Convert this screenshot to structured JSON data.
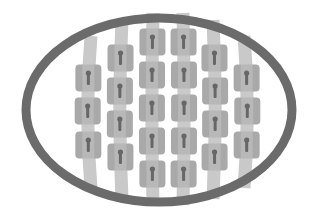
{
  "diagram": {
    "type": "illustration",
    "colors": {
      "background": "#ffffff",
      "ellipse_stroke": "#6b6b6b",
      "strap": "#c9c9c9",
      "block": "#a9a9a9",
      "keyhole": "#676767"
    },
    "ellipse": {
      "cx": 159,
      "cy": 110,
      "rx": 133,
      "ry": 92,
      "stroke_width": 9
    },
    "block_size": {
      "w": 26,
      "h": 27
    },
    "columns": [
      {
        "x": 88,
        "strap_top": 36,
        "strap_bottom": 188,
        "curve": -6,
        "blocks": [
          78,
          111,
          145
        ]
      },
      {
        "x": 120,
        "strap_top": 20,
        "strap_bottom": 199,
        "curve": -4,
        "blocks": [
          58,
          91,
          124,
          157
        ]
      },
      {
        "x": 152,
        "strap_top": 13,
        "strap_bottom": 205,
        "curve": -2,
        "blocks": [
          42,
          75,
          108,
          141,
          174
        ]
      },
      {
        "x": 184,
        "strap_top": 13,
        "strap_bottom": 205,
        "curve": 2,
        "blocks": [
          42,
          75,
          108,
          141,
          174
        ]
      },
      {
        "x": 215,
        "strap_top": 20,
        "strap_bottom": 199,
        "curve": 4,
        "blocks": [
          58,
          91,
          124,
          157
        ]
      },
      {
        "x": 247,
        "strap_top": 36,
        "strap_bottom": 188,
        "curve": 6,
        "blocks": [
          78,
          111,
          145
        ]
      }
    ],
    "block_counts": [
      3,
      4,
      5,
      5,
      4,
      3
    ]
  }
}
